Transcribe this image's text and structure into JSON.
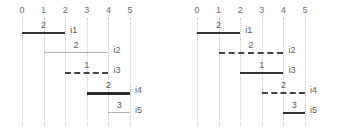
{
  "figure": {
    "width": 350,
    "height": 132,
    "background": "#ffffff",
    "grid_color": "#c3c3c3",
    "text_color": "#5a5a5a",
    "panel_count": 2
  },
  "chart_data": [
    {
      "type": "bar",
      "orientation": "horizontal",
      "subtype": "gantt-interval",
      "panel": "left",
      "title": "",
      "xlabel": "",
      "ylabel": "",
      "xlim": [
        0,
        5
      ],
      "ylim": [
        0,
        5
      ],
      "grid": true,
      "grid_axis": "x",
      "legend": "none",
      "xticks": [
        0,
        1,
        2,
        3,
        4,
        5
      ],
      "xticklabels": [
        "0",
        "1",
        "2",
        "3",
        "4",
        "5"
      ],
      "categories": [
        "i1",
        "i2",
        "i3",
        "i4",
        "i5"
      ],
      "bars": [
        {
          "label": "i1",
          "start": 0,
          "end": 2,
          "duration": 2,
          "value": "2",
          "style": "solid-dark"
        },
        {
          "label": "i2",
          "start": 1,
          "end": 4,
          "duration": 3,
          "value": "2",
          "style": "solid-light"
        },
        {
          "label": "i3",
          "start": 2,
          "end": 4,
          "duration": 2,
          "value": "1",
          "style": "dashed-dark"
        },
        {
          "label": "i4",
          "start": 3,
          "end": 5,
          "duration": 2,
          "value": "2",
          "style": "solid-thick"
        },
        {
          "label": "i5",
          "start": 4,
          "end": 5,
          "duration": 1,
          "value": "3",
          "style": "solid-light"
        }
      ]
    },
    {
      "type": "bar",
      "orientation": "horizontal",
      "subtype": "gantt-interval",
      "panel": "right",
      "title": "",
      "xlabel": "",
      "ylabel": "",
      "xlim": [
        0,
        5
      ],
      "ylim": [
        0,
        5
      ],
      "grid": true,
      "grid_axis": "x",
      "legend": "none",
      "xticks": [
        0,
        1,
        2,
        3,
        4,
        5
      ],
      "xticklabels": [
        "0",
        "1",
        "2",
        "3",
        "4",
        "5"
      ],
      "categories": [
        "i1",
        "i2",
        "i3",
        "i4",
        "i5"
      ],
      "bars": [
        {
          "label": "i1",
          "start": 0,
          "end": 2,
          "duration": 2,
          "value": "2",
          "style": "solid-dark"
        },
        {
          "label": "i2",
          "start": 1,
          "end": 4,
          "duration": 3,
          "value": "2",
          "style": "dashed-dark"
        },
        {
          "label": "i3",
          "start": 2,
          "end": 4,
          "duration": 2,
          "value": "1",
          "style": "solid-dark"
        },
        {
          "label": "i4",
          "start": 3,
          "end": 5,
          "duration": 2,
          "value": "2",
          "style": "dashed-dark"
        },
        {
          "label": "i5",
          "start": 4,
          "end": 5,
          "duration": 1,
          "value": "3",
          "style": "solid-dark"
        }
      ]
    }
  ]
}
